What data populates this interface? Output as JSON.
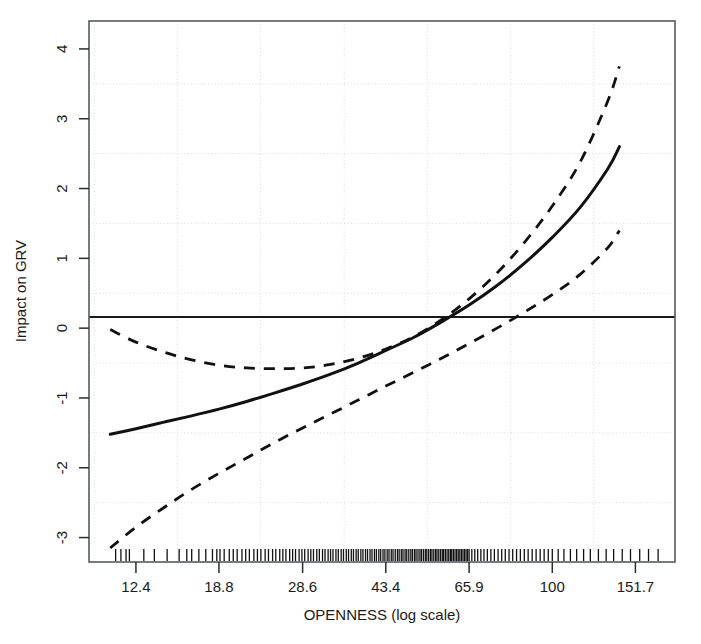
{
  "chart_data": {
    "type": "line",
    "title": "",
    "xlabel": "OPENNESS (log scale)",
    "ylabel": "Impact on GRV",
    "x_scale": "log",
    "grid": true,
    "legend": "none",
    "xtick_labels": [
      "12.4",
      "18.8",
      "28.6",
      "43.4",
      "65.9",
      "100",
      "151.7"
    ],
    "xtick_values": [
      12.4,
      18.8,
      28.6,
      43.4,
      65.9,
      100,
      151.7
    ],
    "ytick_labels": [
      "-3",
      "-2",
      "-1",
      "0",
      "1",
      "2",
      "3",
      "4"
    ],
    "ytick_values": [
      -3,
      -2,
      -1,
      0,
      1,
      2,
      3,
      4
    ],
    "xlim": [
      9.8,
      185.0
    ],
    "ylim": [
      -3.35,
      4.4
    ],
    "reference_line": {
      "label": "zero line",
      "y": 0,
      "style": "solid"
    },
    "series": [
      {
        "name": "Fitted effect",
        "style": "solid",
        "x": [
          10.9,
          12.4,
          14.2,
          16.3,
          18.8,
          21.6,
          24.8,
          28.6,
          32.9,
          37.8,
          43.4,
          50.0,
          57.4,
          65.9,
          75.8,
          87.0,
          100.0,
          115.0,
          132.0,
          140.0
        ],
        "values": [
          -1.52,
          -1.44,
          -1.35,
          -1.26,
          -1.16,
          -1.05,
          -0.93,
          -0.8,
          -0.66,
          -0.5,
          -0.32,
          -0.13,
          0.09,
          0.33,
          0.61,
          0.93,
          1.3,
          1.73,
          2.28,
          2.6
        ]
      },
      {
        "name": "Upper confidence bound",
        "style": "dashed",
        "x": [
          10.9,
          12.4,
          14.2,
          16.3,
          18.8,
          21.6,
          24.8,
          28.6,
          32.9,
          37.8,
          43.4,
          50.0,
          57.4,
          65.9,
          75.8,
          87.0,
          100.0,
          115.0,
          132.0,
          140.0
        ],
        "values": [
          -0.02,
          -0.2,
          -0.34,
          -0.45,
          -0.53,
          -0.57,
          -0.58,
          -0.57,
          -0.52,
          -0.43,
          -0.3,
          -0.12,
          0.12,
          0.42,
          0.79,
          1.23,
          1.75,
          2.38,
          3.25,
          3.75
        ]
      },
      {
        "name": "Lower confidence bound",
        "style": "dashed",
        "x": [
          10.9,
          12.4,
          14.2,
          16.3,
          18.8,
          21.6,
          24.8,
          28.6,
          32.9,
          37.8,
          43.4,
          50.0,
          57.4,
          65.9,
          75.8,
          87.0,
          100.0,
          115.0,
          132.0,
          140.0
        ],
        "values": [
          -3.15,
          -2.85,
          -2.58,
          -2.32,
          -2.08,
          -1.86,
          -1.64,
          -1.43,
          -1.23,
          -1.03,
          -0.83,
          -0.63,
          -0.43,
          -0.22,
          0.0,
          0.23,
          0.48,
          0.77,
          1.15,
          1.4
        ]
      }
    ],
    "rug": {
      "name": "observation rug",
      "note": "tick marks along bottom axis indicating observed OPENNESS values",
      "values": [
        11.2,
        11.5,
        11.8,
        12.0,
        12.9,
        13.6,
        14.5,
        15.4,
        16.0,
        16.4,
        17.0,
        17.6,
        18.2,
        18.6,
        18.9,
        19.3,
        19.8,
        20.2,
        20.6,
        21.1,
        21.5,
        21.9,
        22.4,
        22.8,
        23.2,
        23.7,
        24.1,
        24.6,
        25.0,
        25.5,
        25.9,
        26.3,
        26.8,
        27.2,
        27.6,
        28.1,
        28.5,
        28.9,
        29.4,
        29.8,
        30.2,
        30.7,
        31.1,
        31.6,
        32.0,
        32.5,
        32.9,
        33.3,
        33.8,
        34.2,
        34.7,
        35.1,
        35.6,
        36.0,
        36.5,
        36.9,
        37.4,
        37.8,
        38.3,
        38.7,
        39.2,
        39.6,
        40.1,
        40.5,
        41.0,
        41.4,
        41.9,
        42.3,
        42.8,
        43.2,
        43.7,
        44.1,
        44.6,
        45.0,
        45.5,
        46.0,
        46.4,
        46.9,
        47.3,
        47.8,
        48.2,
        48.7,
        49.2,
        49.6,
        50.1,
        50.5,
        51.0,
        51.5,
        51.9,
        52.4,
        52.9,
        53.3,
        53.8,
        54.3,
        54.7,
        55.2,
        55.7,
        56.1,
        56.6,
        57.1,
        57.6,
        58.0,
        58.5,
        59.0,
        59.5,
        60.0,
        60.4,
        60.9,
        61.4,
        61.9,
        62.4,
        62.9,
        63.4,
        63.9,
        64.4,
        64.9,
        65.4,
        65.9,
        66.8,
        67.8,
        68.8,
        69.9,
        71.0,
        72.2,
        73.5,
        74.8,
        76.2,
        77.6,
        79.0,
        80.5,
        82.0,
        83.6,
        85.2,
        86.9,
        88.6,
        90.4,
        92.2,
        94.1,
        96.0,
        98.0,
        100.0,
        103.0,
        106.0,
        109.5,
        113.0,
        117.0,
        121.0,
        126.0,
        131.0,
        136.0,
        142.0,
        148.0,
        155.0,
        162.0,
        170.0
      ]
    }
  },
  "labels": {
    "x_axis_title": "OPENNESS (log scale)",
    "y_axis_title": "Impact on GRV"
  }
}
